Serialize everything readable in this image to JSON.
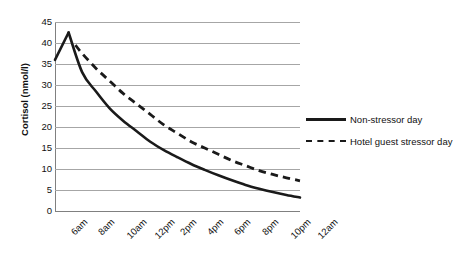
{
  "chart_data": {
    "type": "line",
    "title": "",
    "xlabel": "",
    "ylabel": "Cortisol (nmol/l)",
    "ylim": [
      0,
      45
    ],
    "ytick_step": 5,
    "yticks": [
      45,
      40,
      35,
      30,
      25,
      20,
      15,
      10,
      5,
      0
    ],
    "grid": true,
    "legend_position": "right",
    "categories": [
      "6am",
      "8am",
      "10am",
      "12pm",
      "2pm",
      "4pm",
      "6pm",
      "8pm",
      "10pm",
      "12am"
    ],
    "x_hours": [
      6,
      8,
      10,
      12,
      14,
      16,
      18,
      20,
      22,
      24
    ],
    "series": [
      {
        "name": "Non-stressor day",
        "style": "solid",
        "color": "#1a1a1a",
        "points": [
          {
            "x": 6,
            "label": "6am",
            "y": 36.0
          },
          {
            "x": 7,
            "label": "7am",
            "y": 42.5
          },
          {
            "x": 8,
            "label": "8am",
            "y": 33.0
          },
          {
            "x": 9,
            "label": "9am",
            "y": 28.5
          },
          {
            "x": 10,
            "label": "10am",
            "y": 24.5
          },
          {
            "x": 11,
            "label": "11am",
            "y": 21.5
          },
          {
            "x": 12,
            "label": "12pm",
            "y": 19.0
          },
          {
            "x": 13,
            "label": "1pm",
            "y": 16.5
          },
          {
            "x": 14,
            "label": "2pm",
            "y": 14.5
          },
          {
            "x": 15,
            "label": "3pm",
            "y": 12.8
          },
          {
            "x": 16,
            "label": "4pm",
            "y": 11.2
          },
          {
            "x": 17,
            "label": "5pm",
            "y": 9.8
          },
          {
            "x": 18,
            "label": "6pm",
            "y": 8.5
          },
          {
            "x": 19,
            "label": "7pm",
            "y": 7.3
          },
          {
            "x": 20,
            "label": "8pm",
            "y": 6.2
          },
          {
            "x": 21,
            "label": "9pm",
            "y": 5.3
          },
          {
            "x": 22,
            "label": "10pm",
            "y": 4.5
          },
          {
            "x": 23,
            "label": "11pm",
            "y": 3.8
          },
          {
            "x": 24,
            "label": "12am",
            "y": 3.2
          }
        ]
      },
      {
        "name": "Hotel guest stressor day",
        "style": "dashed",
        "color": "#1a1a1a",
        "points": [
          {
            "x": 7.5,
            "label": "7:30am",
            "y": 39.5
          },
          {
            "x": 8,
            "label": "8am",
            "y": 37.5
          },
          {
            "x": 9,
            "label": "9am",
            "y": 34.0
          },
          {
            "x": 10,
            "label": "10am",
            "y": 31.0
          },
          {
            "x": 11,
            "label": "11am",
            "y": 28.0
          },
          {
            "x": 12,
            "label": "12pm",
            "y": 25.5
          },
          {
            "x": 13,
            "label": "1pm",
            "y": 23.0
          },
          {
            "x": 14,
            "label": "2pm",
            "y": 20.5
          },
          {
            "x": 15,
            "label": "3pm",
            "y": 18.5
          },
          {
            "x": 16,
            "label": "4pm",
            "y": 16.5
          },
          {
            "x": 17,
            "label": "5pm",
            "y": 15.0
          },
          {
            "x": 18,
            "label": "6pm",
            "y": 13.5
          },
          {
            "x": 19,
            "label": "7pm",
            "y": 12.0
          },
          {
            "x": 20,
            "label": "8pm",
            "y": 10.8
          },
          {
            "x": 21,
            "label": "9pm",
            "y": 9.6
          },
          {
            "x": 22,
            "label": "10pm",
            "y": 8.7
          },
          {
            "x": 23,
            "label": "11pm",
            "y": 7.9
          },
          {
            "x": 24,
            "label": "12am",
            "y": 7.2
          }
        ]
      }
    ]
  },
  "axis": {
    "y_title": "Cortisol (nmol/l)",
    "y_ticks": [
      "45",
      "40",
      "35",
      "30",
      "25",
      "20",
      "15",
      "10",
      "5",
      "0"
    ],
    "x_ticks": [
      "6am",
      "8am",
      "10am",
      "12pm",
      "2pm",
      "4pm",
      "6pm",
      "8pm",
      "10pm",
      "12am"
    ]
  },
  "legend": {
    "entries": [
      {
        "label": "Non-stressor day",
        "style": "solid"
      },
      {
        "label": "Hotel guest stressor day",
        "style": "dashed"
      }
    ]
  },
  "colors": {
    "line": "#1a1a1a",
    "gridline": "#a6a6a6",
    "axis": "#808080",
    "text": "#111111",
    "background": "#ffffff"
  }
}
